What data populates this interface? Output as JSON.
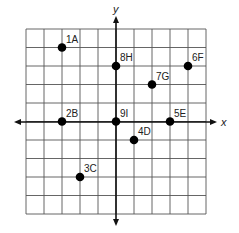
{
  "diagram": {
    "type": "coordinate-grid",
    "axes": {
      "x_label": "x",
      "y_label": "y"
    },
    "grid": {
      "cols": 10,
      "rows": 10,
      "x_range": [
        -5,
        5
      ],
      "y_range": [
        -5,
        5
      ]
    },
    "colors": {
      "grid": "#555555",
      "axis": "#111111",
      "point": "#000000"
    },
    "points": [
      {
        "label": "1A",
        "x": -3,
        "y": 4
      },
      {
        "label": "2B",
        "x": -3,
        "y": 0
      },
      {
        "label": "3C",
        "x": -2,
        "y": -3
      },
      {
        "label": "4D",
        "x": 1,
        "y": -1
      },
      {
        "label": "5E",
        "x": 3,
        "y": 0
      },
      {
        "label": "6F",
        "x": 4,
        "y": 3
      },
      {
        "label": "7G",
        "x": 2,
        "y": 2
      },
      {
        "label": "8H",
        "x": 0,
        "y": 3
      },
      {
        "label": "9I",
        "x": 0,
        "y": 0
      }
    ]
  }
}
